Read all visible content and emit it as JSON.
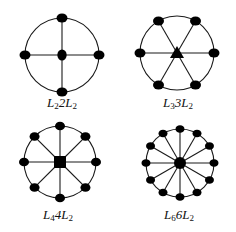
{
  "figure": {
    "background": "#ffffff",
    "line_color": "#1a1a1a",
    "node_color": "#000000",
    "diagrams": [
      {
        "id": "L2-2L2",
        "label": {
          "L": "L",
          "sub1": "2",
          "mid": "2L",
          "sub2": "2"
        },
        "label_text": "L2 2L2",
        "cx": 62,
        "cy": 55,
        "r": 37,
        "outer_nodes": 4,
        "start_angle_deg": -90,
        "node_rx": 5.5,
        "node_ry": 4.5,
        "center_shape": "ellipse",
        "center_size": 5.5,
        "label_x": 62,
        "label_y": 96
      },
      {
        "id": "L3-3L2",
        "label": {
          "L": "L",
          "sub1": "3",
          "mid": "3L",
          "sub2": "2"
        },
        "label_text": "L3 3L2",
        "cx": 177,
        "cy": 53,
        "r": 37,
        "outer_nodes": 6,
        "start_angle_deg": 0,
        "node_rx": 5.5,
        "node_ry": 4.5,
        "center_shape": "triangle",
        "center_size": 7,
        "label_x": 178,
        "label_y": 96
      },
      {
        "id": "L4-4L2",
        "label": {
          "L": "L",
          "sub1": "4",
          "mid": "4L",
          "sub2": "2"
        },
        "label_text": "L4 4L2",
        "cx": 60,
        "cy": 162,
        "r": 36,
        "outer_nodes": 8,
        "start_angle_deg": -90,
        "node_rx": 5,
        "node_ry": 4.3,
        "center_shape": "square",
        "center_size": 6,
        "label_x": 58,
        "label_y": 208
      },
      {
        "id": "L6-6L2",
        "label": {
          "L": "L",
          "sub1": "6",
          "mid": "6L",
          "sub2": "2"
        },
        "label_text": "L6 6L2",
        "cx": 180,
        "cy": 163,
        "r": 34,
        "outer_nodes": 12,
        "start_angle_deg": -90,
        "node_rx": 4.5,
        "node_ry": 3.8,
        "center_shape": "circle",
        "center_size": 6,
        "label_x": 179,
        "label_y": 208
      }
    ]
  }
}
